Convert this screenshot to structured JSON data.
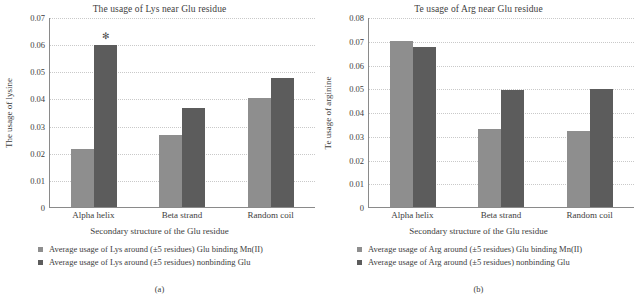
{
  "figure": {
    "panels": [
      {
        "caption": "(a)",
        "chart_data": {
          "type": "bar",
          "title": "The usage of Lys near Glu residue",
          "xlabel": "Secondary structure of the Glu residue",
          "ylabel": "The usage of lysine",
          "categories": [
            "Alpha helix",
            "Beta strand",
            "Random coil"
          ],
          "ylim": [
            0,
            0.07
          ],
          "yticks": [
            "0",
            "0.01",
            "0.02",
            "0.03",
            "0.04",
            "0.05",
            "0.06",
            "0.07"
          ],
          "ytick_values": [
            0,
            0.01,
            0.02,
            0.03,
            0.04,
            0.05,
            0.06,
            0.07
          ],
          "grid": true,
          "legend_position": "below",
          "series": [
            {
              "name": "Average usage of Lys around (±5 residues) Glu binding Mn(II)",
              "color": "#8e8e8e",
              "values": [
                0.0215,
                0.0265,
                0.0403
              ]
            },
            {
              "name": "Average usage of Lys around (±5 residues) nonbinding Glu",
              "color": "#5c5c5c",
              "values": [
                0.0598,
                0.0365,
                0.0475
              ]
            }
          ],
          "annotations": [
            {
              "category": "Alpha helix",
              "series": 1,
              "text": "✻"
            }
          ]
        }
      },
      {
        "caption": "(b)",
        "chart_data": {
          "type": "bar",
          "title": "Te usage of Arg near Glu residue",
          "xlabel": "Secondary structure of the Glu residue",
          "ylabel": "Te usage of arginine",
          "categories": [
            "Alpha helix",
            "Beta strand",
            "Random coil"
          ],
          "ylim": [
            0,
            0.08
          ],
          "yticks": [
            "0",
            "0.01",
            "0.02",
            "0.03",
            "0.04",
            "0.05",
            "0.06",
            "0.07",
            "0.08"
          ],
          "ytick_values": [
            0,
            0.01,
            0.02,
            0.03,
            0.04,
            0.05,
            0.06,
            0.07,
            0.08
          ],
          "grid": true,
          "legend_position": "below",
          "series": [
            {
              "name": "Average usage of Arg around (±5 residues) Glu binding Mn(II)",
              "color": "#8e8e8e",
              "values": [
                0.0697,
                0.0327,
                0.0322
              ]
            },
            {
              "name": "Average usage of Arg around (±5 residues) nonbinding Glu",
              "color": "#5c5c5c",
              "values": [
                0.0675,
                0.0492,
                0.0495
              ]
            }
          ],
          "annotations": []
        }
      }
    ]
  }
}
